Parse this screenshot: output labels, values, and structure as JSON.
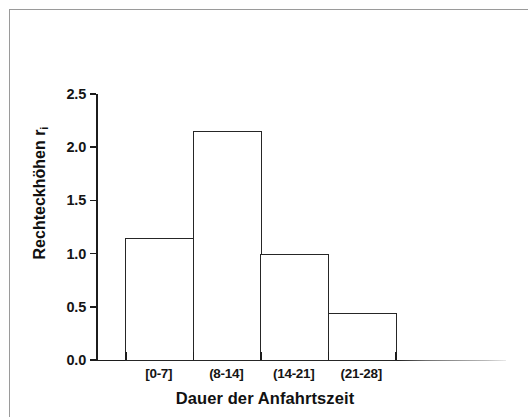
{
  "figure": {
    "background_color": "#ffffff",
    "border_color": "#9a9a9a",
    "axis_color": "#1c1c1c",
    "bar_edge_color": "#262626",
    "bar_fill_color": "#ffffff"
  },
  "chart_data": {
    "type": "bar",
    "title": "",
    "subtitle": "",
    "xlabel": "Dauer der Anfahrtszeit",
    "ylabel": "Rechteckhöhen r",
    "ylabel_subscript": "i",
    "categories": [
      "[0-7]",
      "(8-14]",
      "(14-21]",
      "(21-28]"
    ],
    "values": [
      1.15,
      2.15,
      1.0,
      0.44
    ],
    "ylim": [
      0.0,
      2.5
    ],
    "yticks": [
      "0.0",
      "0.5",
      "1.0",
      "1.5",
      "2.0",
      "2.5"
    ],
    "ytick_values": [
      0.0,
      0.5,
      1.0,
      1.5,
      2.0,
      2.5
    ],
    "grid": false,
    "legend": false,
    "legend_position": "none",
    "bar_gap": 0,
    "annotations": []
  }
}
